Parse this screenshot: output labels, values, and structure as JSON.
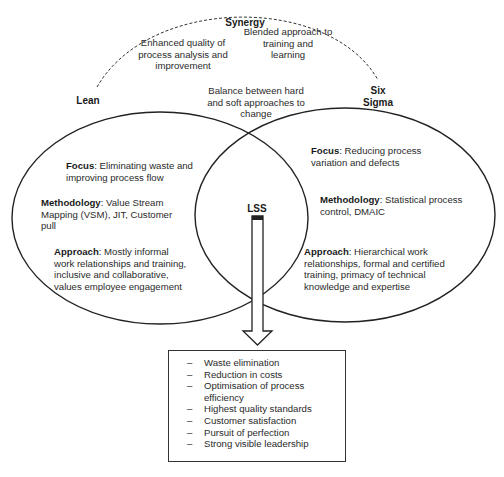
{
  "synergy": {
    "title": "Synergy",
    "points": [
      {
        "text": "Enhanced quality of process analysis and improvement"
      },
      {
        "text": "Blended approach to training and learning"
      },
      {
        "text": "Balance between hard and soft approaches to change"
      }
    ],
    "lines": {
      "enhanced": [
        "Enhanced quality of",
        "process analysis and",
        "improvement"
      ],
      "blended": [
        "Blended approach to",
        "training and",
        "learning"
      ],
      "balance": [
        "Balance between hard",
        "and soft approaches to",
        "change"
      ]
    }
  },
  "lean": {
    "label": "Lean",
    "focus": {
      "key": "Focus",
      "value": ": Eliminating waste and improving process flow",
      "lines": [
        ": Eliminating waste and",
        "improving process flow"
      ]
    },
    "methodology": {
      "key": "Methodology",
      "value": ": Value Stream Mapping (VSM), JIT, Customer pull",
      "lines": [
        ": Value Stream",
        "Mapping (VSM), JIT, Customer",
        "pull"
      ]
    },
    "approach": {
      "key": "Approach",
      "value": ": Mostly informal work relationships and training, inclusive and collaborative, values employee engagement",
      "lines": [
        ": Mostly informal",
        "work relationships and training,",
        "inclusive and collaborative,",
        "values employee engagement"
      ]
    }
  },
  "six_sigma": {
    "label_line1": "Six",
    "label_line2": "Sigma",
    "focus": {
      "key": "Focus",
      "value": ": Reducing process variation and defects",
      "lines": [
        ": Reducing process",
        "variation and defects"
      ]
    },
    "methodology": {
      "key": "Methodology",
      "value": ": Statistical process control, DMAIC",
      "lines": [
        ": Statistical process",
        "control, DMAIC"
      ]
    },
    "approach": {
      "key": "Approach",
      "value": ": Hierarchical work relationships, formal and certified training, primacy of technical knowledge and expertise",
      "lines": [
        ": Hierarchical work",
        "relationships, formal and certified",
        "training, primacy of technical",
        "knowledge and expertise"
      ]
    }
  },
  "lss": {
    "label": "LSS",
    "outcomes": [
      "Waste elimination",
      "Reduction in costs",
      "Optimisation of process efficiency",
      "Highest quality standards",
      "Customer satisfaction",
      "Pursuit of perfection",
      "Strong visible leadership"
    ],
    "outcome_lines": [
      [
        "Waste elimination"
      ],
      [
        "Reduction in costs"
      ],
      [
        "Optimisation of process",
        "efficiency"
      ],
      [
        "Highest quality standards"
      ],
      [
        "Customer satisfaction"
      ],
      [
        "Pursuit of perfection"
      ],
      [
        "Strong visible leadership"
      ]
    ],
    "bullet": "–"
  },
  "colors": {
    "stroke": "#222222",
    "text": "#2a2a2a",
    "background": "#ffffff"
  }
}
